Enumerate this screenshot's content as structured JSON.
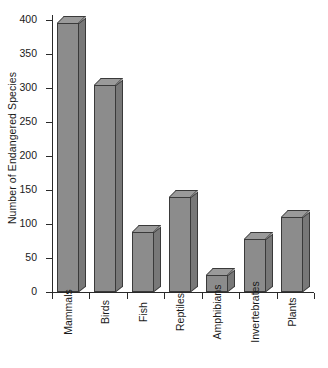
{
  "chart_data": {
    "type": "bar",
    "title": "",
    "xlabel": "",
    "ylabel": "Number of Endangered Species",
    "categories": [
      "Mammals",
      "Birds",
      "Fish",
      "Reptiles",
      "Amphibians",
      "Invertebrates",
      "Plants"
    ],
    "values": [
      396,
      304,
      88,
      140,
      25,
      78,
      110
    ],
    "ylim": [
      0,
      400
    ],
    "yticks": [
      0,
      50,
      100,
      150,
      200,
      250,
      300,
      350,
      400
    ],
    "ytick_labels": [
      "0",
      "50",
      "100",
      "150",
      "200",
      "250",
      "300",
      "350",
      "400"
    ],
    "grid": false,
    "legend": "none",
    "bar_style": "3d-shaded",
    "colors": {
      "bar_face": "#8c8c8c",
      "bar_side": "#787878",
      "bar_top": "#9a9a9a",
      "bar_edge": "#3a3a3a",
      "axis": "#2a2a2a",
      "text": "#1a1a1a",
      "background": "#ffffff"
    }
  },
  "caption": ""
}
